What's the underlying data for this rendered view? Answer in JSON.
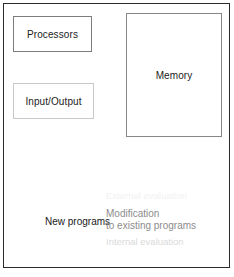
{
  "diagram": {
    "frame_border_color": "#2b2b2b",
    "background_color": "#ffffff",
    "components": [
      {
        "name": "processors",
        "label": "Processors",
        "border_color": "#7d7d7d",
        "text_color": "#1c1c1c"
      },
      {
        "name": "input-output",
        "label": "Input/Output",
        "border_color": "#c9c9c9",
        "text_color": "#1c1c1c"
      },
      {
        "name": "memory",
        "label": "Memory",
        "border_color": "#878787",
        "text_color": "#1c1c1c"
      }
    ],
    "annotations": [
      {
        "name": "external-evaluation",
        "label": "External evaluation",
        "color": "#f2f2f2"
      },
      {
        "name": "new-programs",
        "label": "New programs",
        "color": "#191919"
      },
      {
        "name": "modification",
        "line1": "Modification",
        "line2": "to existing programs",
        "color": "#8c8c8c"
      },
      {
        "name": "internal-evaluation",
        "label": "Internal evaluation",
        "color": "#dadada"
      }
    ]
  }
}
